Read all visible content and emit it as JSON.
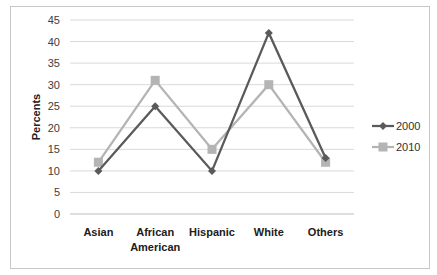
{
  "chart_data": {
    "type": "line",
    "title": "",
    "xlabel": "",
    "ylabel": "Percents",
    "ylim": [
      0,
      45
    ],
    "yticks": [
      0,
      5,
      10,
      15,
      20,
      25,
      30,
      35,
      40,
      45
    ],
    "grid": true,
    "legend_position": "right",
    "categories": [
      "Asian",
      "African American",
      "Hispanic",
      "White",
      "Others"
    ],
    "category_lines": [
      [
        "Asian"
      ],
      [
        "African",
        "American"
      ],
      [
        "Hispanic"
      ],
      [
        "White"
      ],
      [
        "Others"
      ]
    ],
    "series": [
      {
        "name": "2000",
        "values": [
          10,
          25,
          10,
          42,
          13
        ],
        "color": "#5a5a5a",
        "marker": "diamond"
      },
      {
        "name": "2010",
        "values": [
          12,
          31,
          15,
          30,
          12
        ],
        "color": "#b4b4b4",
        "marker": "square"
      }
    ]
  }
}
